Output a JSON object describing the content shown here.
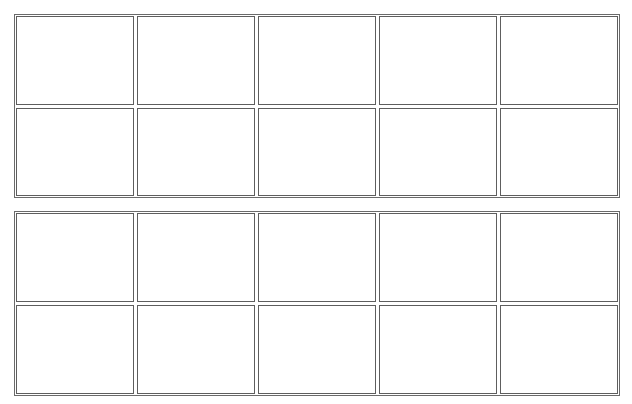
{
  "diagram": {
    "type": "ten-frames",
    "frames": [
      {
        "id": "ten-frame-1",
        "rows": 2,
        "columns": 5,
        "filled_cells": []
      },
      {
        "id": "ten-frame-2",
        "rows": 2,
        "columns": 5,
        "filled_cells": []
      }
    ],
    "colors": {
      "border": "#5e5e5e",
      "background": "#ffffff"
    }
  }
}
